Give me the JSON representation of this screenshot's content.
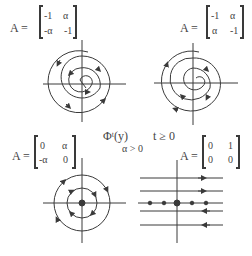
{
  "panels": [
    {
      "id": "stable-focus-cw",
      "label_prefix": "A =",
      "matrix": [
        [
          "-1",
          "α"
        ],
        [
          "-α",
          "-1"
        ]
      ]
    },
    {
      "id": "stable-focus-ccw",
      "label_prefix": "A =",
      "matrix": [
        [
          "-1",
          "α"
        ],
        [
          "α",
          "-1"
        ]
      ]
    },
    {
      "id": "center",
      "label_prefix": "A =",
      "matrix": [
        [
          "0",
          "α"
        ],
        [
          "-α",
          "0"
        ]
      ]
    },
    {
      "id": "degenerate-shear",
      "label_prefix": "A =",
      "matrix": [
        [
          "0",
          "1"
        ],
        [
          "0",
          "0"
        ]
      ]
    }
  ],
  "center_caption": {
    "flow": "Φᵗ(y)",
    "time": "t ≥ 0",
    "condition": "α > 0"
  },
  "colors": {
    "ink": "#3a3a3a",
    "background": "#ffffff"
  }
}
